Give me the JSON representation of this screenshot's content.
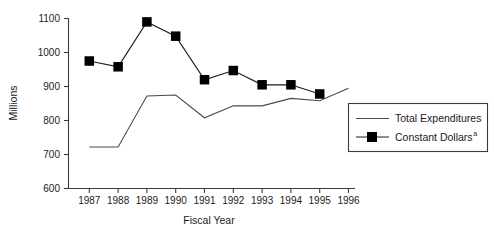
{
  "chart_data": {
    "type": "line",
    "title": "",
    "subtitle": "",
    "xlabel": "Fiscal Year",
    "ylabel": "Millions",
    "categories": [
      "1987",
      "1988",
      "1989",
      "1990",
      "1991",
      "1992",
      "1993",
      "1994",
      "1995",
      "1996"
    ],
    "x": [
      1987,
      1988,
      1989,
      1990,
      1991,
      1992,
      1993,
      1994,
      1995,
      1996
    ],
    "xlim": [
      1987,
      1996
    ],
    "ylim": [
      600,
      1100
    ],
    "yticks": [
      600,
      700,
      800,
      900,
      1000,
      1100
    ],
    "ytick_labels": [
      "600",
      "700",
      "800",
      "900",
      "1000",
      "1100"
    ],
    "grid": false,
    "legend_position": "right",
    "series": [
      {
        "name": "Total Expenditures",
        "marker": "none",
        "x": [
          1987,
          1988,
          1989,
          1990,
          1991,
          1992,
          1993,
          1994,
          1995,
          1996
        ],
        "values": [
          722,
          722,
          872,
          875,
          808,
          843,
          843,
          865,
          858,
          895
        ]
      },
      {
        "name": "Constant Dollars",
        "name_superscript": "a",
        "marker": "square",
        "x": [
          1987,
          1988,
          1989,
          1990,
          1991,
          1992,
          1993,
          1994,
          1995
        ],
        "values": [
          975,
          958,
          1090,
          1048,
          920,
          947,
          905,
          905,
          878
        ]
      }
    ],
    "colors": {
      "total_expenditures": "#4a4a4a",
      "constant_dollars": "#000000",
      "axis": "#3b3b3b",
      "text": "#1a1a1a",
      "background": "#ffffff"
    }
  },
  "axes": {
    "y_title": "Millions",
    "x_title": "Fiscal Year",
    "y_tick_labels": [
      "1100",
      "1000",
      "900",
      "800",
      "700",
      "600"
    ],
    "x_tick_labels": [
      "1987",
      "1988",
      "1989",
      "1990",
      "1991",
      "1992",
      "1993",
      "1994",
      "1995",
      "1996"
    ]
  },
  "legend": {
    "entries": [
      {
        "label": "Total Expenditures",
        "superscript": ""
      },
      {
        "label": "Constant Dollars",
        "superscript": "a"
      }
    ]
  }
}
